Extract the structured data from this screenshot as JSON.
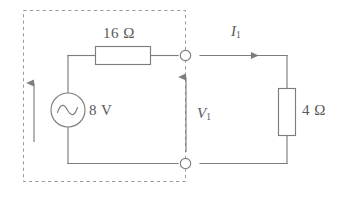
{
  "figure": {
    "colors": {
      "wire": "#7d7d7d",
      "dashed_box": "#9a9a9a",
      "component_fill": "#ffffff",
      "text": "#595959",
      "background": "#ffffff"
    }
  },
  "labels": {
    "series_resistor": "16 Ω",
    "source_voltage": "8 V",
    "load_resistor": "4 Ω",
    "current_symbol": "I",
    "current_subscript": "1",
    "voltage_symbol": "V",
    "voltage_subscript": "1"
  },
  "components": {
    "source": {
      "type": "ac-voltage-source",
      "symbol": "sine",
      "value": "8 V"
    },
    "series_resistor": {
      "type": "resistor",
      "orientation": "horizontal",
      "value": "16 Ω"
    },
    "load_resistor": {
      "type": "resistor",
      "orientation": "vertical",
      "value": "4 Ω"
    },
    "terminals": [
      {
        "name": "top-terminal",
        "style": "open-circle"
      },
      {
        "name": "bottom-terminal",
        "style": "open-circle"
      }
    ],
    "arrows": [
      {
        "name": "source-current-arrow",
        "direction": "up"
      },
      {
        "name": "port-voltage-arrow",
        "direction": "up",
        "label": "V1"
      },
      {
        "name": "load-current-arrow",
        "direction": "right",
        "label": "I1"
      }
    ],
    "enclosure": {
      "name": "source-network-box",
      "style": "dashed"
    }
  }
}
